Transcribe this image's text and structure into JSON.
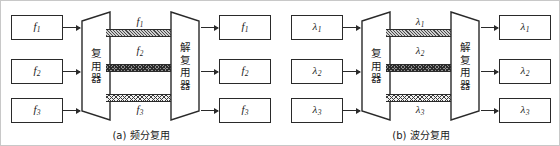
{
  "figure": {
    "panels": [
      {
        "id": "a",
        "caption": "(a) 频分复用",
        "mux_label": [
          "复",
          "用",
          "器"
        ],
        "demux_label": [
          "解",
          "复",
          "用",
          "器"
        ],
        "inputs": [
          {
            "symbol": "f",
            "sub": "1"
          },
          {
            "symbol": "f",
            "sub": "2"
          },
          {
            "symbol": "f",
            "sub": "3"
          }
        ],
        "outputs": [
          {
            "symbol": "f",
            "sub": "1"
          },
          {
            "symbol": "f",
            "sub": "2"
          },
          {
            "symbol": "f",
            "sub": "3"
          }
        ],
        "channels": [
          {
            "symbol": "f",
            "sub": "1",
            "pattern": "diagonal-hatch"
          },
          {
            "symbol": "f",
            "sub": "2",
            "pattern": "dark-crosshatch"
          },
          {
            "symbol": "f",
            "sub": "3",
            "pattern": "light-crosshatch"
          }
        ]
      },
      {
        "id": "b",
        "caption": "(b) 波分复用",
        "mux_label": [
          "复",
          "用",
          "器"
        ],
        "demux_label": [
          "解",
          "复",
          "用",
          "器"
        ],
        "inputs": [
          {
            "symbol": "λ",
            "sub": "1"
          },
          {
            "symbol": "λ",
            "sub": "2"
          },
          {
            "symbol": "λ",
            "sub": "3"
          }
        ],
        "outputs": [
          {
            "symbol": "λ",
            "sub": "1"
          },
          {
            "symbol": "λ",
            "sub": "2"
          },
          {
            "symbol": "λ",
            "sub": "3"
          }
        ],
        "channels": [
          {
            "symbol": "λ",
            "sub": "1",
            "pattern": "diagonal-hatch"
          },
          {
            "symbol": "λ",
            "sub": "2",
            "pattern": "dark-crosshatch"
          },
          {
            "symbol": "λ",
            "sub": "3",
            "pattern": "light-crosshatch"
          }
        ]
      }
    ],
    "colors": {
      "stroke": "#2a2a2a",
      "border": "#c8c8c8",
      "background": "#ffffff"
    }
  }
}
